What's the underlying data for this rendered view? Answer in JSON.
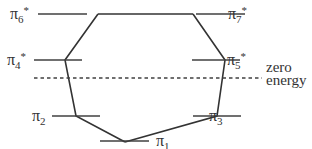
{
  "diagram": {
    "title_partial": "...benzene system",
    "levels": [
      {
        "id": "pi6",
        "label": "π",
        "sub": "6",
        "sup": "*",
        "side": "left"
      },
      {
        "id": "pi7",
        "label": "π",
        "sub": "7",
        "sup": "*",
        "side": "right"
      },
      {
        "id": "pi4",
        "label": "π",
        "sub": "4",
        "sup": "*",
        "side": "left"
      },
      {
        "id": "pi5",
        "label": "π",
        "sub": "5",
        "sup": "*",
        "side": "right"
      },
      {
        "id": "pi2",
        "label": "π",
        "sub": "2",
        "sup": "",
        "side": "left"
      },
      {
        "id": "pi3",
        "label": "π",
        "sub": "3",
        "sup": "",
        "side": "right"
      },
      {
        "id": "pi1",
        "label": "π",
        "sub": "1",
        "sup": "",
        "side": "right"
      }
    ],
    "zero_energy": {
      "line1": "zero",
      "line2": "energy"
    }
  }
}
